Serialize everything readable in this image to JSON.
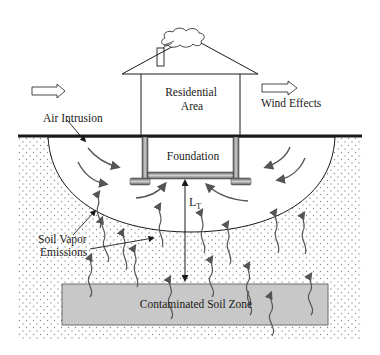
{
  "diagram": {
    "labels": {
      "residential_line1": "Residential",
      "residential_line2": "Area",
      "wind_effects": "Wind Effects",
      "air_intrusion": "Air Intrusion",
      "foundation": "Foundation",
      "lt_main": "L",
      "lt_sub": "T",
      "soil_vapor_line1": "Soil Vapor",
      "soil_vapor_line2": "Emissions",
      "contaminated_zone": "Contaminated Soil Zone"
    },
    "colors": {
      "ground_line": "#1a1a1a",
      "contaminated_fill": "#c8c8c8",
      "contaminated_border": "#6e6e6e",
      "soil_dots": "#8a8a8a",
      "arrow": "#555555",
      "foundation_fill": "#9a9a9a"
    }
  }
}
